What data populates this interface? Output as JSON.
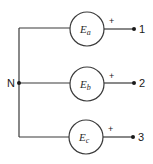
{
  "diagram": {
    "type": "three-phase-wye-source",
    "neutral_label": "N",
    "sources": [
      {
        "symbol": "E",
        "subscript": "a",
        "polarity": "+",
        "terminal": "1"
      },
      {
        "symbol": "E",
        "subscript": "b",
        "polarity": "+",
        "terminal": "2"
      },
      {
        "symbol": "E",
        "subscript": "c",
        "polarity": "+",
        "terminal": "3"
      }
    ],
    "colors": {
      "line": "#3a3a3a",
      "text": "#1a1a1a",
      "background": "#ffffff"
    }
  }
}
